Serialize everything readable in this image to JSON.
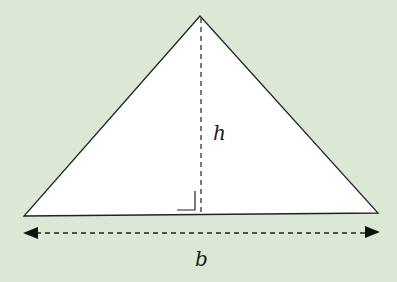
{
  "diagram": {
    "type": "triangle-area-figure",
    "background_color": "#dbe8d6",
    "triangle": {
      "fill": "#ffffff",
      "stroke": "#222222",
      "vertices": {
        "apex": [
          200,
          16
        ],
        "base_left": [
          24,
          216
        ],
        "base_right": [
          378,
          213
        ]
      }
    },
    "height_line": {
      "style": "dashed",
      "from": [
        201,
        16
      ],
      "to": [
        201,
        214
      ]
    },
    "right_angle_marker": {
      "corner": [
        195,
        210
      ]
    },
    "base_measure_arrow": {
      "style": "dashed double-headed",
      "y": 233,
      "from_x": 23,
      "to_x": 380
    },
    "labels": {
      "height": "h",
      "base": "b"
    }
  }
}
